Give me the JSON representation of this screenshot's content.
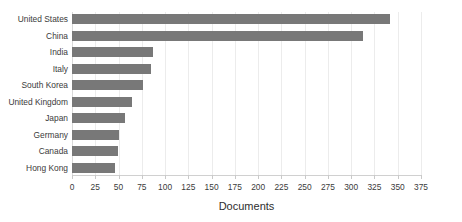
{
  "chart_data": {
    "type": "bar",
    "orientation": "horizontal",
    "title": "",
    "xlabel": "Documents",
    "ylabel": "",
    "categories": [
      "United States",
      "China",
      "India",
      "Italy",
      "South Korea",
      "United Kingdom",
      "Japan",
      "Germany",
      "Canada",
      "Hong Kong"
    ],
    "values": [
      342,
      313,
      87,
      85,
      76,
      64,
      57,
      51,
      49,
      46
    ],
    "xlim": [
      0,
      375
    ],
    "xticks": [
      0,
      25,
      50,
      75,
      100,
      125,
      150,
      175,
      200,
      225,
      250,
      275,
      300,
      325,
      350,
      375
    ],
    "grid": true,
    "legend": false,
    "bar_color": "#787878",
    "background_color": "#ffffff",
    "text_color": "#3b3b3b",
    "gridline_color": "#ececec"
  }
}
